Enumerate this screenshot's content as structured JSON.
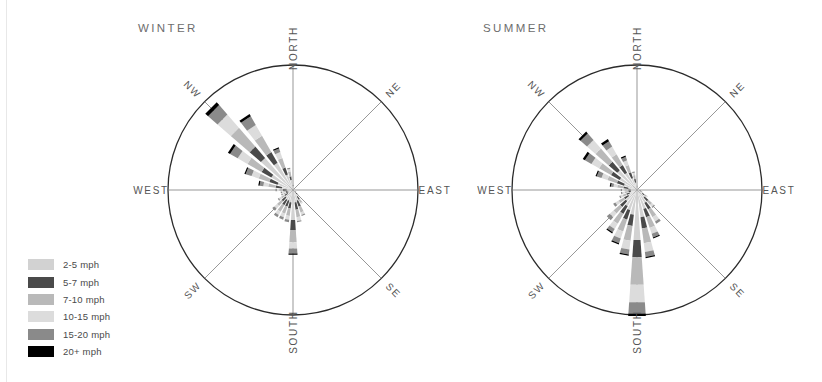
{
  "chart_data": {
    "type": "windrose-pair",
    "title": "",
    "legend": {
      "position": "bottom-left",
      "entries": [
        {
          "label": "2-5 mph",
          "color": "#d2d2d2"
        },
        {
          "label": "5-7 mph",
          "color": "#4a4a4a"
        },
        {
          "label": "7-10 mph",
          "color": "#b9b9b9"
        },
        {
          "label": "10-15 mph",
          "color": "#dcdcdc"
        },
        {
          "label": "15-20 mph",
          "color": "#8a8a8a"
        },
        {
          "label": "20+ mph",
          "color": "#000000"
        }
      ]
    },
    "bins": [
      "2-5 mph",
      "5-7 mph",
      "7-10 mph",
      "10-15 mph",
      "15-20 mph",
      "20+ mph"
    ],
    "bin_colors": [
      "#d2d2d2",
      "#4a4a4a",
      "#b9b9b9",
      "#dcdcdc",
      "#8a8a8a",
      "#000000"
    ],
    "directions": [
      "N",
      "NNE",
      "NE",
      "ENE",
      "E",
      "ESE",
      "SE",
      "SSE",
      "S",
      "SSW",
      "SW",
      "WSW",
      "W",
      "WNW",
      "NW",
      "NNW"
    ],
    "compass_labels": [
      "NORTH",
      "NE",
      "EAST",
      "SE",
      "SOUTH",
      "SW",
      "WEST",
      "NW"
    ],
    "radial_max": 100,
    "grid": "8-spoke",
    "charts": [
      {
        "name": "winter",
        "title": "WINTER",
        "center": {
          "x": 173,
          "y": 190
        },
        "radius": 125,
        "petals": [
          {
            "angle": 0,
            "segments": [
              3,
              1,
              1,
              0,
              0,
              0
            ]
          },
          {
            "angle": 11.25,
            "segments": [
              2,
              0,
              0,
              0,
              0,
              0
            ]
          },
          {
            "angle": 22.5,
            "segments": [
              1,
              0,
              0,
              0,
              0,
              0
            ]
          },
          {
            "angle": 33.75,
            "segments": [
              1,
              0,
              0,
              0,
              0,
              0
            ]
          },
          {
            "angle": 45,
            "segments": [
              1,
              0,
              0,
              0,
              0,
              0
            ]
          },
          {
            "angle": 56.25,
            "segments": [
              1,
              0,
              0,
              0,
              0,
              0
            ]
          },
          {
            "angle": 67.5,
            "segments": [
              1,
              0,
              0,
              0,
              0,
              0
            ]
          },
          {
            "angle": 78.75,
            "segments": [
              1,
              0,
              0,
              0,
              0,
              0
            ]
          },
          {
            "angle": 90,
            "segments": [
              1,
              0,
              0,
              0,
              0,
              0
            ]
          },
          {
            "angle": 101.25,
            "segments": [
              1,
              0,
              0,
              0,
              0,
              0
            ]
          },
          {
            "angle": 112.5,
            "segments": [
              2,
              0,
              0,
              0,
              0,
              0
            ]
          },
          {
            "angle": 123.75,
            "segments": [
              2,
              1,
              0,
              0,
              0,
              0
            ]
          },
          {
            "angle": 135,
            "segments": [
              3,
              2,
              1,
              0,
              0,
              0
            ]
          },
          {
            "angle": 146.25,
            "segments": [
              6,
              3,
              3,
              1,
              0,
              0
            ]
          },
          {
            "angle": 157.5,
            "segments": [
              9,
              5,
              5,
              2,
              1,
              0
            ]
          },
          {
            "angle": 168.75,
            "segments": [
              10,
              6,
              6,
              3,
              1,
              0
            ]
          },
          {
            "angle": 180,
            "segments": [
              24,
              8,
              10,
              5,
              4,
              1
            ]
          },
          {
            "angle": 191.25,
            "segments": [
              10,
              5,
              6,
              3,
              2,
              0
            ]
          },
          {
            "angle": 202.5,
            "segments": [
              9,
              5,
              6,
              3,
              2,
              0
            ]
          },
          {
            "angle": 213.75,
            "segments": [
              9,
              5,
              6,
              3,
              2,
              0
            ]
          },
          {
            "angle": 225,
            "segments": [
              8,
              4,
              5,
              3,
              2,
              0
            ]
          },
          {
            "angle": 236.25,
            "segments": [
              5,
              3,
              3,
              2,
              1,
              0
            ]
          },
          {
            "angle": 247.5,
            "segments": [
              4,
              2,
              2,
              1,
              1,
              0
            ]
          },
          {
            "angle": 258.75,
            "segments": [
              4,
              2,
              2,
              1,
              1,
              0
            ]
          },
          {
            "angle": 270,
            "segments": [
              5,
              3,
              3,
              2,
              1,
              0
            ]
          },
          {
            "angle": 281.25,
            "segments": [
              9,
              5,
              6,
              4,
              3,
              1
            ]
          },
          {
            "angle": 292.5,
            "segments": [
              13,
              7,
              9,
              6,
              5,
              1
            ]
          },
          {
            "angle": 303.75,
            "segments": [
              20,
              9,
              13,
              9,
              7,
              2
            ]
          },
          {
            "angle": 315,
            "segments": [
              34,
              12,
              20,
              14,
              10,
              3
            ]
          },
          {
            "angle": 326.25,
            "segments": [
              25,
              10,
              15,
              10,
              8,
              2
            ]
          },
          {
            "angle": 337.5,
            "segments": [
              13,
              6,
              8,
              5,
              3,
              1
            ]
          },
          {
            "angle": 348.75,
            "segments": [
              8,
              3,
              4,
              2,
              1,
              0
            ]
          }
        ]
      },
      {
        "name": "summer",
        "title": "SUMMER",
        "center": {
          "x": 172,
          "y": 190
        },
        "radius": 125,
        "petals": [
          {
            "angle": 0,
            "segments": [
              2,
              1,
              1,
              0,
              0,
              0
            ]
          },
          {
            "angle": 11.25,
            "segments": [
              2,
              0,
              0,
              0,
              0,
              0
            ]
          },
          {
            "angle": 22.5,
            "segments": [
              1,
              0,
              0,
              0,
              0,
              0
            ]
          },
          {
            "angle": 33.75,
            "segments": [
              1,
              0,
              0,
              0,
              0,
              0
            ]
          },
          {
            "angle": 45,
            "segments": [
              1,
              0,
              0,
              0,
              0,
              0
            ]
          },
          {
            "angle": 56.25,
            "segments": [
              1,
              0,
              0,
              0,
              0,
              0
            ]
          },
          {
            "angle": 67.5,
            "segments": [
              1,
              0,
              0,
              0,
              0,
              0
            ]
          },
          {
            "angle": 78.75,
            "segments": [
              1,
              0,
              0,
              0,
              0,
              0
            ]
          },
          {
            "angle": 90,
            "segments": [
              2,
              0,
              0,
              0,
              0,
              0
            ]
          },
          {
            "angle": 101.25,
            "segments": [
              2,
              1,
              0,
              0,
              0,
              0
            ]
          },
          {
            "angle": 112.5,
            "segments": [
              3,
              1,
              1,
              0,
              0,
              0
            ]
          },
          {
            "angle": 123.75,
            "segments": [
              5,
              2,
              2,
              1,
              0,
              0
            ]
          },
          {
            "angle": 135,
            "segments": [
              8,
              4,
              4,
              2,
              1,
              0
            ]
          },
          {
            "angle": 146.25,
            "segments": [
              12,
              6,
              7,
              4,
              2,
              0
            ]
          },
          {
            "angle": 157.5,
            "segments": [
              16,
              7,
              9,
              5,
              3,
              1
            ]
          },
          {
            "angle": 168.75,
            "segments": [
              22,
              9,
              12,
              7,
              4,
              1
            ]
          },
          {
            "angle": 180,
            "segments": [
              40,
              14,
              22,
              14,
              9,
              2
            ]
          },
          {
            "angle": 191.25,
            "segments": [
              20,
              9,
              12,
              7,
              4,
              1
            ]
          },
          {
            "angle": 202.5,
            "segments": [
              17,
              8,
              10,
              6,
              4,
              1
            ]
          },
          {
            "angle": 213.75,
            "segments": [
              15,
              7,
              9,
              5,
              3,
              1
            ]
          },
          {
            "angle": 225,
            "segments": [
              12,
              6,
              7,
              4,
              3,
              0
            ]
          },
          {
            "angle": 236.25,
            "segments": [
              8,
              4,
              5,
              3,
              2,
              0
            ]
          },
          {
            "angle": 247.5,
            "segments": [
              6,
              3,
              3,
              2,
              1,
              0
            ]
          },
          {
            "angle": 258.75,
            "segments": [
              5,
              2,
              3,
              2,
              1,
              0
            ]
          },
          {
            "angle": 270,
            "segments": [
              5,
              2,
              3,
              2,
              1,
              0
            ]
          },
          {
            "angle": 281.25,
            "segments": [
              7,
              4,
              5,
              3,
              2,
              1
            ]
          },
          {
            "angle": 292.5,
            "segments": [
              11,
              6,
              8,
              5,
              4,
              1
            ]
          },
          {
            "angle": 303.75,
            "segments": [
              16,
              8,
              11,
              7,
              6,
              2
            ]
          },
          {
            "angle": 315,
            "segments": [
              21,
              9,
              14,
              9,
              7,
              2
            ]
          },
          {
            "angle": 326.25,
            "segments": [
              16,
              7,
              10,
              7,
              5,
              2
            ]
          },
          {
            "angle": 337.5,
            "segments": [
              10,
              5,
              6,
              4,
              3,
              1
            ]
          },
          {
            "angle": 348.75,
            "segments": [
              6,
              3,
              3,
              2,
              1,
              0
            ]
          }
        ]
      }
    ]
  },
  "style": {
    "circle_stroke": "#2b2b2b",
    "spoke_stroke": "#6a6a6a",
    "label_color": "#555555",
    "title_color": "#6d6d6d",
    "background": "#ffffff"
  }
}
